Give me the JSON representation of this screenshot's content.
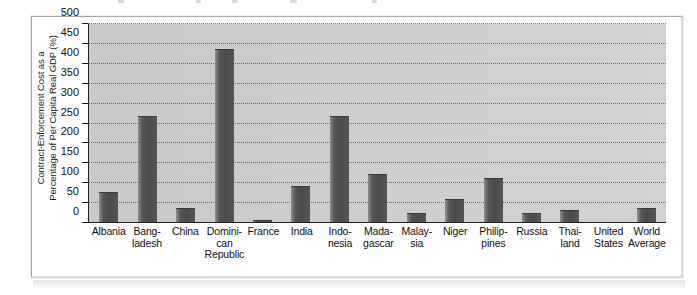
{
  "figure": {
    "y_axis_title": "Contract-Enforcement Cost as a\nPercentage of Per Capita Real GDP (%)"
  },
  "chart_data": {
    "type": "bar",
    "title": "",
    "xlabel": "",
    "ylabel": "Contract-Enforcement Cost as a Percentage of Per Capita Real GDP (%)",
    "ylim": [
      0,
      500
    ],
    "ytick_step": 50,
    "yticks": [
      0,
      50,
      100,
      150,
      200,
      250,
      300,
      350,
      400,
      450,
      500
    ],
    "ytick_labels": [
      "0",
      "50",
      "100",
      "150",
      "200",
      "250",
      "300",
      "350",
      "400",
      "450",
      "500"
    ],
    "grid": true,
    "legend": "none",
    "categories": [
      "Albania",
      "Bang-\nladesh",
      "China",
      "Domini-\ncan\nRepublic",
      "France",
      "India",
      "Indo-\nnesia",
      "Mada-\ngascar",
      "Malay-\nsia",
      "Niger",
      "Philip-\npines",
      "Russia",
      "Thai-\nland",
      "United\nStates",
      "World\nAverage"
    ],
    "category_names": [
      "Albania",
      "Bangladesh",
      "China",
      "Dominican Republic",
      "France",
      "India",
      "Indonesia",
      "Madagascar",
      "Malaysia",
      "Niger",
      "Philippines",
      "Russia",
      "Thailand",
      "United States",
      "World Average"
    ],
    "values": [
      75,
      268,
      35,
      437,
      5,
      90,
      268,
      120,
      22,
      57,
      110,
      22,
      28,
      0,
      35
    ],
    "bar_color": "#4a4a4a",
    "plot_background": "#cdcdcd",
    "gridline_color": "#585858"
  }
}
